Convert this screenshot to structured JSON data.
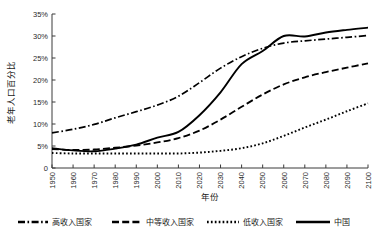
{
  "chart_data": {
    "type": "line",
    "title": "",
    "xlabel": "年份",
    "ylabel": "老年人口百分比",
    "grid": false,
    "legend_position": "bottom",
    "xlim": [
      1950,
      2100
    ],
    "ylim": [
      0,
      35
    ],
    "x_tick_labels": [
      "1950",
      "1960",
      "1970",
      "1980",
      "1990",
      "2000",
      "2010",
      "2020",
      "2030",
      "2040",
      "2050",
      "2060",
      "2070",
      "2080",
      "2090",
      "2100"
    ],
    "y_tick_labels": [
      "0",
      "5%",
      "10%",
      "15%",
      "20%",
      "25%",
      "30%",
      "35%"
    ],
    "y_tick_values": [
      0,
      5,
      10,
      15,
      20,
      25,
      30,
      35
    ],
    "x": [
      1950,
      1960,
      1970,
      1980,
      1990,
      2000,
      2010,
      2020,
      2030,
      2040,
      2050,
      2060,
      2070,
      2080,
      2090,
      2100
    ],
    "series": [
      {
        "name": "高收入国家",
        "style": "dash-dot",
        "values": [
          8.0,
          8.8,
          9.9,
          11.4,
          12.8,
          14.3,
          16.3,
          19.4,
          22.7,
          25.3,
          27.2,
          28.4,
          28.9,
          29.3,
          29.7,
          30.1
        ]
      },
      {
        "name": "中等收入国家",
        "style": "dashed",
        "values": [
          4.3,
          4.1,
          4.2,
          4.6,
          5.1,
          5.8,
          6.8,
          8.5,
          11.0,
          13.9,
          16.7,
          19.0,
          20.6,
          21.8,
          22.8,
          23.8
        ]
      },
      {
        "name": "低收入国家",
        "style": "dotted",
        "values": [
          3.4,
          3.3,
          3.3,
          3.3,
          3.3,
          3.3,
          3.3,
          3.5,
          3.9,
          4.5,
          5.6,
          7.3,
          9.2,
          11.0,
          12.9,
          14.7
        ]
      },
      {
        "name": "中国",
        "style": "solid",
        "values": [
          4.5,
          4.0,
          3.8,
          4.4,
          5.3,
          6.9,
          8.2,
          12.0,
          17.2,
          23.6,
          26.6,
          30.0,
          29.9,
          30.8,
          31.4,
          31.9
        ]
      }
    ],
    "legend_entries": [
      {
        "label": "高收入国家",
        "style": "dash-dot"
      },
      {
        "label": "中等收入国家",
        "style": "dashed"
      },
      {
        "label": "低收入国家",
        "style": "dotted"
      },
      {
        "label": "中国",
        "style": "solid"
      }
    ]
  }
}
